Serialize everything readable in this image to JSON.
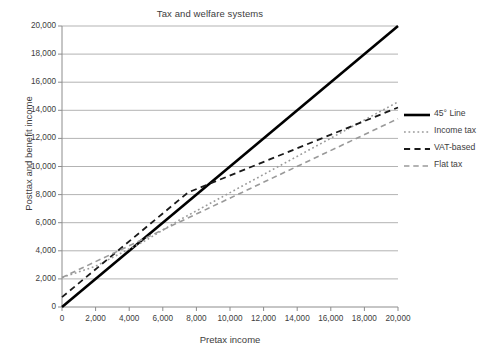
{
  "chart_data": {
    "type": "line",
    "title": "Tax and welfare systems",
    "xlabel": "Pretax income",
    "ylabel": "Posttax and benefit income",
    "xlim": [
      0,
      20000
    ],
    "ylim": [
      0,
      20000
    ],
    "grid": "horizontal",
    "legend_position": "right",
    "xticks": [
      "0",
      "2,000",
      "4,000",
      "6,000",
      "8,000",
      "10,000",
      "12,000",
      "14,000",
      "16,000",
      "18,000",
      "20,000"
    ],
    "xtick_values": [
      0,
      2000,
      4000,
      6000,
      8000,
      10000,
      12000,
      14000,
      16000,
      18000,
      20000
    ],
    "yticks": [
      "0",
      "2,000",
      "4,000",
      "6,000",
      "8,000",
      "10,000",
      "12,000",
      "14,000",
      "16,000",
      "18,000",
      "20,000"
    ],
    "ytick_values": [
      0,
      2000,
      4000,
      6000,
      8000,
      10000,
      12000,
      14000,
      16000,
      18000,
      20000
    ],
    "series": [
      {
        "name": "45° Line",
        "style": "solid",
        "color": "#000000",
        "width": 2.6,
        "x": [
          0,
          20000
        ],
        "values": [
          0,
          20000
        ]
      },
      {
        "name": "Income tax",
        "style": "dotted",
        "color": "#9a9a9a",
        "width": 1.6,
        "x": [
          0,
          2000,
          5000,
          7000,
          20000
        ],
        "values": [
          2100,
          2900,
          4750,
          6200,
          14600
        ]
      },
      {
        "name": "VAT-based",
        "style": "dashed",
        "color": "#1a1a1a",
        "width": 1.8,
        "x": [
          0,
          7500,
          20000
        ],
        "values": [
          700,
          8150,
          14200
        ]
      },
      {
        "name": "Flat tax",
        "style": "dashed",
        "color": "#9a9a9a",
        "width": 1.6,
        "x": [
          0,
          20000
        ],
        "values": [
          2100,
          13400
        ]
      }
    ]
  },
  "legend": {
    "items": [
      {
        "label": "45° Line",
        "icon": "solid-line-swatch"
      },
      {
        "label": "Income tax",
        "icon": "dotted-line-swatch"
      },
      {
        "label": "VAT-based",
        "icon": "dashed-line-swatch"
      },
      {
        "label": "Flat tax",
        "icon": "dashed-gray-line-swatch"
      }
    ]
  },
  "colors": {
    "background": "#ffffff",
    "gridline": "#b3b3b3",
    "axis": "#8c8c8c",
    "text": "#3d3d3d",
    "series_black": "#000000",
    "series_gray": "#9a9a9a"
  }
}
